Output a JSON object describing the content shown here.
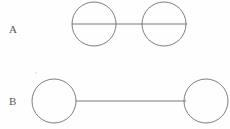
{
  "figure": {
    "width": 230,
    "height": 129,
    "background_color": "#fefefe",
    "stroke_color": "#6e6e6e",
    "label_color": "#585858",
    "rows": [
      {
        "id": "row-a",
        "label": "A",
        "label_x": 13,
        "label_y": 29,
        "description": "two circles joined by a line that passes through both circles as a diameter",
        "edge": {
          "x1": 72,
          "y1": 24,
          "x2": 187,
          "y2": 24,
          "passes_through_nodes": true
        },
        "nodes": [
          {
            "id": "a1",
            "cx": 94,
            "cy": 24,
            "r": 22
          },
          {
            "id": "a2",
            "cx": 164,
            "cy": 24,
            "r": 22
          }
        ]
      },
      {
        "id": "row-b",
        "label": "B",
        "label_x": 13,
        "label_y": 101,
        "description": "two circles joined by a line that touches only the circle edges",
        "edge": {
          "x1": 76,
          "y1": 101,
          "x2": 186,
          "y2": 101,
          "passes_through_nodes": false
        },
        "nodes": [
          {
            "id": "b1",
            "cx": 54,
            "cy": 101,
            "r": 22
          },
          {
            "id": "b2",
            "cx": 206,
            "cy": 101,
            "r": 22
          }
        ]
      }
    ],
    "artifacts": [
      {
        "id": "speck-1",
        "cx": 36,
        "cy": 73,
        "r": 0.8
      }
    ]
  }
}
